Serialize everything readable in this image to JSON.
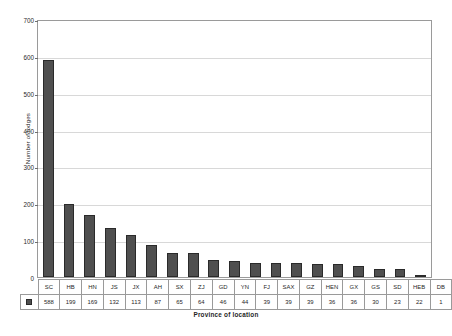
{
  "chart_data": {
    "type": "bar",
    "title": "",
    "xlabel": "Province of location",
    "ylabel": "Number of lodges",
    "categories": [
      "SC",
      "HB",
      "HN",
      "JS",
      "JX",
      "AH",
      "SX",
      "ZJ",
      "GD",
      "YN",
      "FJ",
      "SAX",
      "GZ",
      "HEN",
      "GX",
      "GS",
      "SD",
      "HEB",
      "DB"
    ],
    "values": [
      588,
      199,
      169,
      132,
      113,
      87,
      65,
      64,
      46,
      44,
      39,
      39,
      39,
      36,
      36,
      30,
      23,
      22,
      1
    ],
    "series": [
      {
        "name": "Number of lodges",
        "values": [
          588,
          199,
          169,
          132,
          113,
          87,
          65,
          64,
          46,
          44,
          39,
          39,
          39,
          36,
          36,
          30,
          23,
          22,
          1
        ]
      }
    ],
    "ylim": [
      0,
      700
    ],
    "yticks": [
      0,
      100,
      200,
      300,
      400,
      500,
      600,
      700
    ],
    "ytick_labels": [
      "0",
      "100",
      "200",
      "300",
      "400",
      "500",
      "600",
      "700"
    ],
    "grid": true,
    "legend_position": "data-table-row",
    "bar_color": "#4f4f4f",
    "bar_edge_color": "#2a2a2a",
    "gridline_color": "#d8d8d8",
    "axis_color": "#9a9a9a"
  },
  "table": {
    "legend_marker": "series-swatch"
  }
}
